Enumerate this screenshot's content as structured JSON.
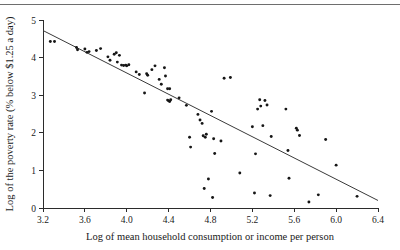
{
  "chart_data": {
    "type": "scatter",
    "title": "",
    "xlabel": "Log of mean household consumption or income per person",
    "ylabel": "Log of the poverty rate (% below $1.25 a day)",
    "xlim": [
      3.2,
      6.4
    ],
    "ylim": [
      0,
      5
    ],
    "xticks": [
      "3.2",
      "3.6",
      "4.0",
      "4.4",
      "4.8",
      "5.2",
      "5.6",
      "6.0",
      "6.4"
    ],
    "yticks": [
      "0",
      "1",
      "2",
      "3",
      "4",
      "5"
    ],
    "grid": false,
    "legend": null,
    "point_color": "#161616",
    "line_color": "#3a3a3a",
    "trendline": {
      "label": "linear fit",
      "x_start": 3.2,
      "y_start": 4.72,
      "x_end": 6.4,
      "y_end": 0.2
    },
    "points": [
      [
        3.27,
        4.43
      ],
      [
        3.31,
        4.43
      ],
      [
        3.52,
        4.27
      ],
      [
        3.53,
        4.21
      ],
      [
        3.6,
        4.23
      ],
      [
        3.62,
        4.14
      ],
      [
        3.64,
        4.16
      ],
      [
        3.71,
        4.19
      ],
      [
        3.75,
        4.24
      ],
      [
        3.82,
        4.02
      ],
      [
        3.84,
        3.93
      ],
      [
        3.88,
        4.09
      ],
      [
        3.9,
        4.13
      ],
      [
        3.91,
        3.88
      ],
      [
        3.93,
        4.06
      ],
      [
        3.95,
        3.8
      ],
      [
        3.97,
        3.79
      ],
      [
        3.99,
        3.8
      ],
      [
        4.0,
        3.78
      ],
      [
        4.02,
        3.81
      ],
      [
        4.09,
        3.62
      ],
      [
        4.12,
        3.55
      ],
      [
        4.17,
        3.06
      ],
      [
        4.19,
        3.57
      ],
      [
        4.2,
        3.53
      ],
      [
        4.24,
        3.68
      ],
      [
        4.27,
        3.78
      ],
      [
        4.31,
        3.42
      ],
      [
        4.33,
        3.29
      ],
      [
        4.36,
        3.73
      ],
      [
        4.37,
        3.51
      ],
      [
        4.39,
        3.17
      ],
      [
        4.41,
        3.17
      ],
      [
        4.39,
        2.87
      ],
      [
        4.4,
        2.85
      ],
      [
        4.41,
        2.83
      ],
      [
        4.42,
        2.88
      ],
      [
        4.5,
        2.93
      ],
      [
        4.57,
        2.73
      ],
      [
        4.6,
        1.88
      ],
      [
        4.61,
        1.62
      ],
      [
        4.68,
        2.49
      ],
      [
        4.7,
        2.34
      ],
      [
        4.72,
        2.25
      ],
      [
        4.73,
        1.92
      ],
      [
        4.75,
        1.88
      ],
      [
        4.76,
        1.96
      ],
      [
        4.74,
        0.52
      ],
      [
        4.78,
        0.77
      ],
      [
        4.81,
        2.57
      ],
      [
        4.83,
        1.84
      ],
      [
        4.84,
        1.45
      ],
      [
        4.82,
        0.28
      ],
      [
        4.9,
        1.78
      ],
      [
        4.93,
        3.45
      ],
      [
        4.99,
        3.47
      ],
      [
        5.08,
        0.93
      ],
      [
        5.2,
        2.16
      ],
      [
        5.23,
        1.44
      ],
      [
        5.25,
        2.63
      ],
      [
        5.27,
        2.88
      ],
      [
        5.28,
        2.71
      ],
      [
        5.3,
        2.19
      ],
      [
        5.32,
        2.86
      ],
      [
        5.34,
        2.74
      ],
      [
        5.22,
        0.4
      ],
      [
        5.37,
        0.33
      ],
      [
        5.38,
        1.9
      ],
      [
        5.52,
        2.63
      ],
      [
        5.54,
        1.53
      ],
      [
        5.55,
        0.79
      ],
      [
        5.62,
        2.12
      ],
      [
        5.63,
        2.07
      ],
      [
        5.65,
        1.93
      ],
      [
        5.74,
        0.16
      ],
      [
        5.83,
        0.35
      ],
      [
        5.9,
        1.82
      ],
      [
        6.0,
        1.14
      ],
      [
        6.2,
        0.31
      ]
    ]
  }
}
